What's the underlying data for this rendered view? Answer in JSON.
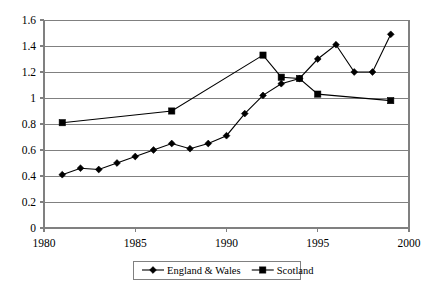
{
  "chart_data": {
    "type": "line",
    "title": "",
    "subtitle": "",
    "xlabel": "",
    "ylabel": "",
    "x": [
      1981,
      1982,
      1983,
      1984,
      1985,
      1986,
      1987,
      1988,
      1989,
      1990,
      1991,
      1992,
      1993,
      1994,
      1995,
      1996,
      1997,
      1998,
      1999
    ],
    "xlim": [
      1980,
      2000
    ],
    "ylim": [
      0,
      1.6
    ],
    "xticks": [
      1980,
      1985,
      1990,
      1995,
      2000
    ],
    "xtick_labels": [
      "1980",
      "1985",
      "1990",
      "1995",
      "2000"
    ],
    "yticks": [
      0,
      0.2,
      0.4,
      0.6,
      0.8,
      1,
      1.2,
      1.4,
      1.6
    ],
    "ytick_labels": [
      "0",
      "0.2",
      "0.4",
      "0.6",
      "0.8",
      "1",
      "1.2",
      "1.4",
      "1.6"
    ],
    "grid": "horizontal",
    "legend_position": "bottom",
    "series": [
      {
        "name": "England & Wales",
        "marker": "diamond",
        "color": "#000000",
        "x": [
          1981,
          1982,
          1983,
          1984,
          1985,
          1986,
          1987,
          1988,
          1989,
          1990,
          1991,
          1992,
          1993,
          1994,
          1995,
          1996,
          1997,
          1998,
          1999
        ],
        "values": [
          0.41,
          0.46,
          0.45,
          0.5,
          0.55,
          0.6,
          0.65,
          0.61,
          0.65,
          0.71,
          0.88,
          1.02,
          1.11,
          1.15,
          1.3,
          1.41,
          1.2,
          1.2,
          1.49
        ]
      },
      {
        "name": "Scotland",
        "marker": "square",
        "color": "#000000",
        "x": [
          1981,
          1987,
          1992,
          1993,
          1994,
          1995,
          1999
        ],
        "values": [
          0.81,
          0.9,
          1.33,
          1.16,
          1.15,
          1.03,
          0.98
        ]
      }
    ]
  },
  "legend": {
    "entries": [
      {
        "label": "England & Wales",
        "marker": "diamond-marker-icon"
      },
      {
        "label": "Scotland",
        "marker": "square-marker-icon"
      }
    ]
  },
  "colors": {
    "line": "#000000",
    "grid": "#808080",
    "axis": "#808080",
    "background": "#ffffff",
    "legend_border": "#808080"
  }
}
